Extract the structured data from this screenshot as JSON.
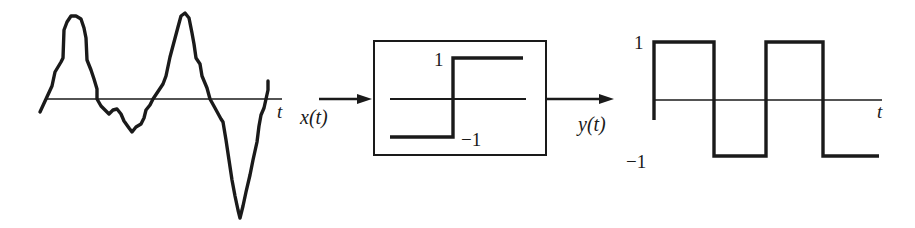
{
  "diagram": {
    "type": "signal-processing block diagram",
    "input_plot": {
      "axis_label": "t",
      "signal": "x(t) arbitrary waveform"
    },
    "block": {
      "function": "sign / hard limiter",
      "upper_level_label": "1",
      "lower_level_label": "−1"
    },
    "input_arrow": {
      "label": "x(t)"
    },
    "output_arrow": {
      "label": "y(t)"
    },
    "output_plot": {
      "axis_label": "t",
      "high_label": "1",
      "low_label": "−1",
      "signal": "square wave y(t) ∈ {−1, 1}"
    },
    "colors": {
      "ink": "#1a1a1a",
      "background": "#ffffff"
    }
  }
}
